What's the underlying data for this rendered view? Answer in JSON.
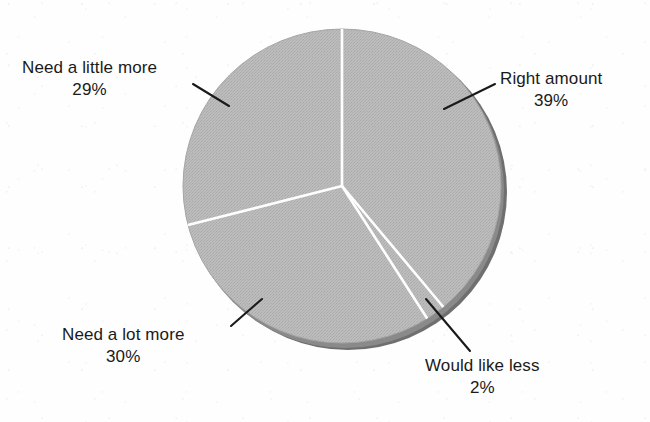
{
  "chart_data": {
    "type": "pie",
    "title": "",
    "subtitle": "",
    "xlabel": "",
    "ylabel": "",
    "legend_position": "none",
    "grid": false,
    "labels_format": "name + percent",
    "categories": [
      "Right amount",
      "Would like less",
      "Need a lot more",
      "Need a little more"
    ],
    "values": [
      39,
      2,
      30,
      29
    ],
    "units": "percent",
    "slices": [
      {
        "label": "Right amount",
        "value": 39,
        "value_text": "39%",
        "start_angle_deg": 0,
        "end_angle_deg": 140.4,
        "color": "#b7b7b7"
      },
      {
        "label": "Would like less",
        "value": 2,
        "value_text": "2%",
        "start_angle_deg": 140.4,
        "end_angle_deg": 147.6,
        "color": "#b7b7b7"
      },
      {
        "label": "Need a lot more",
        "value": 30,
        "value_text": "30%",
        "start_angle_deg": 147.6,
        "end_angle_deg": 255.6,
        "color": "#b7b7b7"
      },
      {
        "label": "Need a little more",
        "value": 29,
        "value_text": "29%",
        "start_angle_deg": 255.6,
        "end_angle_deg": 360,
        "color": "#b7b7b7"
      }
    ],
    "colors": {
      "slice_fill": "#b7b7b7",
      "slice_divider": "#ffffff",
      "rim_shadow": "#6f6f6f",
      "leader_line": "#1a1a1a",
      "text": "#1a1a1a",
      "background": "#fefefe"
    }
  },
  "labels": {
    "need_little_more": {
      "name": "Need a little more",
      "value": "29%"
    },
    "right_amount": {
      "name": "Right amount",
      "value": "39%"
    },
    "need_lot_more": {
      "name": "Need a lot more",
      "value": "30%"
    },
    "would_like_less": {
      "name": "Would like less",
      "value": "2%"
    }
  }
}
